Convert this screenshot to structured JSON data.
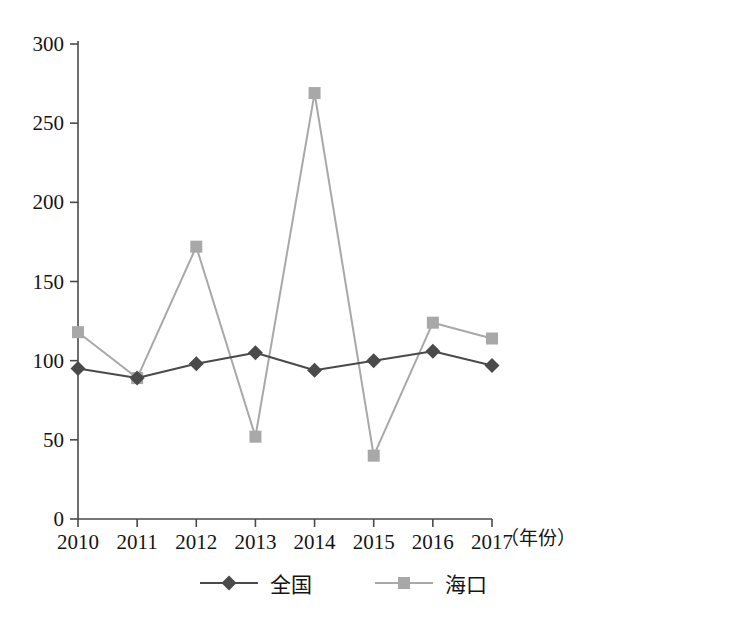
{
  "chart_data": {
    "type": "line",
    "title": "",
    "subtitle": "",
    "xlabel": "（年份）",
    "ylabel": "",
    "categories": [
      "2010",
      "2011",
      "2012",
      "2013",
      "2014",
      "2015",
      "2016",
      "2017"
    ],
    "x": [
      2010,
      2011,
      2012,
      2013,
      2014,
      2015,
      2016,
      2017
    ],
    "series": [
      {
        "name": "全国",
        "marker": "diamond",
        "color": "#4a4a4a",
        "values": [
          95,
          89,
          98,
          105,
          94,
          100,
          106,
          97
        ]
      },
      {
        "name": "海口",
        "marker": "square",
        "color": "#a8a8a8",
        "values": [
          118,
          89,
          172,
          52,
          269,
          40,
          124,
          114
        ]
      }
    ],
    "ylim": [
      0,
      300
    ],
    "yticks": [
      0,
      50,
      100,
      150,
      200,
      250,
      300
    ],
    "ytick_labels": [
      "0",
      "50",
      "100",
      "150",
      "200",
      "250",
      "300"
    ],
    "xtick_labels": [
      "2010",
      "2011",
      "2012",
      "2013",
      "2014",
      "2015",
      "2016",
      "2017"
    ],
    "grid": false,
    "legend_position": "bottom",
    "legend_entries": [
      "全国",
      "海口"
    ]
  },
  "axes": {
    "x_axis_note": "（年份）"
  },
  "legend": {
    "items": [
      {
        "label": "全国"
      },
      {
        "label": "海口"
      }
    ]
  }
}
